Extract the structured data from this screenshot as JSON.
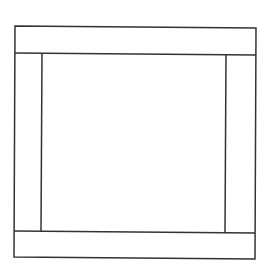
{
  "diagram": {
    "stroke_color": "#333333",
    "background_color": "#ffffff",
    "regions": [
      "top-band",
      "bottom-band",
      "left-panel",
      "right-panel",
      "center-panel"
    ]
  }
}
